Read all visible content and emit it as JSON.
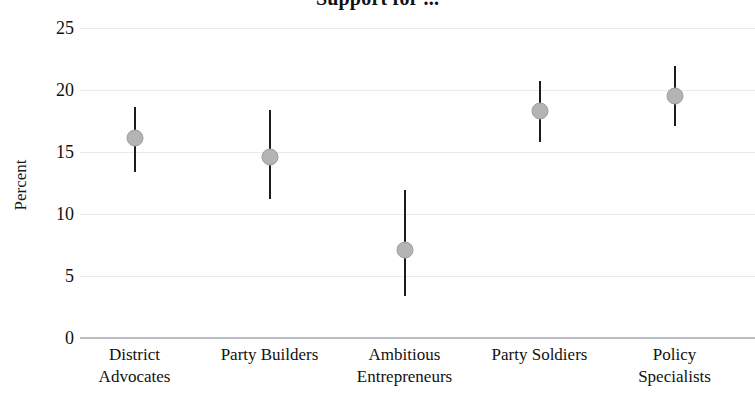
{
  "chart_data": {
    "type": "scatter",
    "title": "Support for ...",
    "xlabel": "",
    "ylabel": "Percent",
    "ylim": [
      0,
      25
    ],
    "yticks": [
      0,
      5,
      10,
      15,
      20,
      25
    ],
    "ytick_labels": [
      "0",
      "5",
      "10",
      "15",
      "20",
      "25"
    ],
    "grid": true,
    "legend": "none",
    "categories": [
      "District Advocates",
      "Party Builders",
      "Ambitious Entrepreneurs",
      "Party Soldiers",
      "Policy Specialists"
    ],
    "category_lines": [
      [
        "District",
        "Advocates"
      ],
      [
        "Party Builders",
        ""
      ],
      [
        "Ambitious",
        "Entrepreneurs"
      ],
      [
        "Party Soldiers",
        ""
      ],
      [
        "Policy",
        "Specialists"
      ]
    ],
    "values": [
      16.1,
      14.6,
      7.1,
      18.3,
      19.5
    ],
    "ci_low": [
      13.4,
      11.2,
      3.4,
      15.8,
      17.1
    ],
    "ci_high": [
      18.6,
      18.4,
      11.9,
      20.7,
      21.9
    ],
    "marker_color": "#b4b4b4",
    "errorbar_color": "#1c1c1c",
    "grid_color": "#e9e9ef",
    "baseline_color": "#bdbdc4",
    "background_color": "#ffffff",
    "points": [
      {
        "category": "District Advocates",
        "value": 16.1,
        "ci_low": 13.4,
        "ci_high": 18.6
      },
      {
        "category": "Party Builders",
        "value": 14.6,
        "ci_low": 11.2,
        "ci_high": 18.4
      },
      {
        "category": "Ambitious Entrepreneurs",
        "value": 7.1,
        "ci_low": 3.4,
        "ci_high": 11.9
      },
      {
        "category": "Party Soldiers",
        "value": 18.3,
        "ci_low": 15.8,
        "ci_high": 20.7
      },
      {
        "category": "Policy Specialists",
        "value": 19.5,
        "ci_low": 17.1,
        "ci_high": 21.9
      }
    ]
  }
}
